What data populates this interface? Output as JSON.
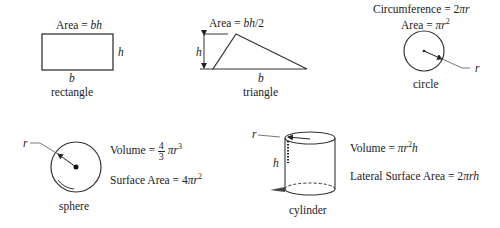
{
  "shapes": {
    "rectangle": {
      "name": "rectangle",
      "formula_prefix": "Area = ",
      "formula_var": "bh",
      "base_label": "b",
      "height_label": "h"
    },
    "triangle": {
      "name": "triangle",
      "formula_prefix": "Area = ",
      "formula_var": "bh",
      "formula_suffix": "/2",
      "base_label": "b",
      "height_label": "h"
    },
    "circle": {
      "name": "circle",
      "circumference_prefix": "Circumference = 2",
      "circumference_var": "πr",
      "area_prefix": "Area = ",
      "area_var": "πr",
      "area_exp": "2",
      "radius_label": "r"
    },
    "sphere": {
      "name": "sphere",
      "volume_prefix": "Volume = ",
      "volume_frac_num": "4",
      "volume_frac_den": "3",
      "volume_var": "πr",
      "volume_exp": "3",
      "surface_prefix": "Surface Area = 4",
      "surface_var": "πr",
      "surface_exp": "2",
      "radius_label": "r"
    },
    "cylinder": {
      "name": "cylinder",
      "volume_prefix": "Volume = ",
      "volume_var1": "πr",
      "volume_exp": "2",
      "volume_var2": "h",
      "lateral_prefix": "Lateral Surface Area = 2",
      "lateral_var": "πrh",
      "radius_label": "r",
      "height_label": "h"
    }
  },
  "colors": {
    "stroke": "#222222",
    "background": "#ffffff"
  }
}
